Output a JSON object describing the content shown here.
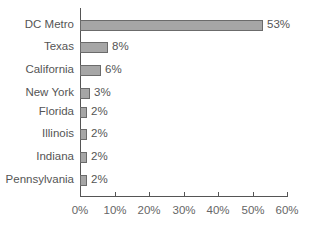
{
  "chart_data": {
    "type": "bar",
    "orientation": "horizontal",
    "title": "",
    "xlabel": "",
    "ylabel": "",
    "categories": [
      "DC Metro",
      "Texas",
      "California",
      "New York",
      "Florida",
      "Illinois",
      "Indiana",
      "Pennsylvania"
    ],
    "values": [
      53,
      8,
      6,
      3,
      2,
      2,
      2,
      2
    ],
    "value_labels": [
      "53%",
      "8%",
      "6%",
      "3%",
      "2%",
      "2%",
      "2%",
      "2%"
    ],
    "xlim": [
      0,
      60
    ],
    "x_ticks": [
      "0%",
      "10%",
      "20%",
      "30%",
      "40%",
      "50%",
      "60%"
    ],
    "grid": false,
    "legend": null,
    "colors": {
      "bar_fill": "#a6a6a6",
      "bar_border": "#6b6b6b",
      "axis": "#555555",
      "text": "#555555"
    }
  }
}
